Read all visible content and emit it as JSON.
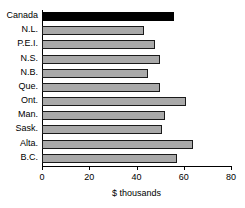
{
  "chart_data": {
    "type": "bar",
    "orientation": "horizontal",
    "title": "",
    "subtitle": "",
    "xlabel": "$ thousands",
    "ylabel": "",
    "categories": [
      "Canada",
      "N.L.",
      "P.E.I.",
      "N.S.",
      "N.B.",
      "Que.",
      "Ont.",
      "Man.",
      "Sask.",
      "Alta.",
      "B.C."
    ],
    "values": [
      56,
      43,
      48,
      50,
      45,
      50,
      61,
      52,
      51,
      64,
      57
    ],
    "xlim": [
      0,
      80
    ],
    "xticks": [
      0,
      20,
      40,
      60,
      80
    ],
    "xtick_labels": [
      "0",
      "20",
      "40",
      "60",
      "80"
    ],
    "grid": false,
    "legend": "none",
    "bar_fill_color": "#a9a9a9",
    "bar_edge_color": "#1a1a1a",
    "highlight_category": "Canada",
    "highlight_color": "#000000",
    "background_color": "#ffffff",
    "axis_color": "#000000"
  }
}
